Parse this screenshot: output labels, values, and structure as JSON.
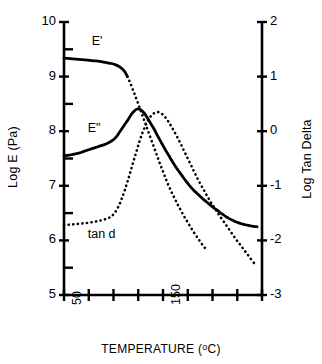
{
  "chart_data": {
    "type": "line",
    "title": "",
    "xlabel": "TEMPERATURE (°C)",
    "ylabel": "Log E (Pa)",
    "y2label": "Log Tan Delta",
    "xlim": [
      50,
      250
    ],
    "ylim": [
      5,
      10
    ],
    "y2lim": [
      -3,
      2
    ],
    "grid": false,
    "legend_position": "inline-annotations",
    "xtick_values": [
      50,
      75,
      100,
      125,
      150,
      175,
      200,
      225,
      250
    ],
    "xtick_labels_shown": [
      "50",
      "150"
    ],
    "xtick_labels_shown_at": [
      50,
      150
    ],
    "ytick_labels_left": [
      "10",
      "9",
      "8",
      "7",
      "6",
      "5"
    ],
    "ytick_values_left": [
      10,
      9,
      8,
      7,
      6,
      5
    ],
    "ytick_labels_right": [
      "2",
      "1",
      "0",
      "-1",
      "-2",
      "-3"
    ],
    "ytick_values_right": [
      2,
      1,
      0,
      -1,
      -2,
      -3
    ],
    "annotations": [
      {
        "text": "E'",
        "x": 78,
        "y_left": 9.62
      },
      {
        "text": "E\"",
        "x": 74,
        "y_left": 8.03
      },
      {
        "text": "tan d",
        "x": 74,
        "y_left": 6.08
      }
    ],
    "series": [
      {
        "name": "E'",
        "axis": "left",
        "style": "solid-then-dotted",
        "x": [
          50,
          56,
          62,
          68,
          74,
          80,
          86,
          92,
          98,
          103,
          107,
          111,
          114,
          117,
          120,
          122.5,
          125,
          127,
          129,
          131,
          133,
          135,
          138,
          141,
          144,
          147,
          150,
          153,
          156,
          159,
          162,
          165,
          168,
          171,
          174,
          177,
          180,
          183,
          186,
          189,
          192,
          195
        ],
        "values": [
          9.34,
          9.33,
          9.32,
          9.31,
          9.3,
          9.29,
          9.28,
          9.26,
          9.24,
          9.21,
          9.17,
          9.1,
          9.0,
          8.88,
          8.74,
          8.62,
          8.5,
          8.4,
          8.3,
          8.2,
          8.1,
          8.0,
          7.85,
          7.7,
          7.55,
          7.4,
          7.26,
          7.12,
          6.99,
          6.87,
          6.76,
          6.65,
          6.55,
          6.45,
          6.36,
          6.27,
          6.18,
          6.1,
          6.02,
          5.94,
          5.87,
          5.8
        ]
      },
      {
        "name": "E\"",
        "axis": "left",
        "style": "solid",
        "x": [
          50,
          55,
          60,
          65,
          70,
          75,
          80,
          85,
          90,
          95,
          99,
          103,
          106,
          109,
          112,
          115,
          117,
          119,
          121,
          123,
          125,
          127,
          129,
          131,
          133,
          135,
          138,
          141,
          145,
          149,
          153,
          157,
          161,
          165,
          169,
          173,
          177,
          181,
          185,
          189,
          193,
          197,
          201,
          205,
          210,
          215,
          220,
          225,
          230,
          235,
          240,
          245
        ],
        "values": [
          7.55,
          7.56,
          7.58,
          7.6,
          7.63,
          7.66,
          7.69,
          7.72,
          7.75,
          7.79,
          7.83,
          7.9,
          7.98,
          8.06,
          8.14,
          8.22,
          8.28,
          8.33,
          8.37,
          8.4,
          8.41,
          8.4,
          8.37,
          8.33,
          8.28,
          8.22,
          8.13,
          8.04,
          7.9,
          7.77,
          7.64,
          7.52,
          7.4,
          7.29,
          7.19,
          7.09,
          7.0,
          6.92,
          6.85,
          6.78,
          6.72,
          6.66,
          6.6,
          6.55,
          6.48,
          6.42,
          6.37,
          6.33,
          6.3,
          6.28,
          6.26,
          6.25
        ]
      },
      {
        "name": "tan d",
        "axis": "right",
        "style": "dotted",
        "x": [
          50,
          56,
          62,
          68,
          74,
          80,
          86,
          92,
          97,
          101,
          105,
          108,
          111,
          114,
          117,
          120,
          123,
          126,
          129,
          132,
          135,
          138,
          141,
          144,
          147,
          150,
          153,
          156,
          159,
          163,
          167,
          171,
          175,
          179,
          183,
          187,
          191,
          195,
          199,
          203,
          208,
          213,
          218,
          223,
          228,
          233,
          238,
          243
        ],
        "values": [
          -1.72,
          -1.71,
          -1.7,
          -1.69,
          -1.68,
          -1.66,
          -1.64,
          -1.61,
          -1.57,
          -1.5,
          -1.38,
          -1.25,
          -1.1,
          -0.93,
          -0.75,
          -0.56,
          -0.38,
          -0.2,
          -0.04,
          0.09,
          0.2,
          0.28,
          0.33,
          0.35,
          0.34,
          0.3,
          0.24,
          0.16,
          0.07,
          -0.06,
          -0.2,
          -0.35,
          -0.5,
          -0.65,
          -0.8,
          -0.94,
          -1.07,
          -1.2,
          -1.32,
          -1.43,
          -1.57,
          -1.7,
          -1.83,
          -1.96,
          -2.08,
          -2.2,
          -2.32,
          -2.44
        ]
      }
    ]
  },
  "axes": {
    "left_title": "Log E (Pa)",
    "right_title": "Log Tan Delta",
    "x_title_main": "TEMPERATURE (",
    "x_title_deg": "o",
    "x_title_tail": "C)"
  },
  "labels": {
    "e_prime": "E'",
    "e_double_prime": "E\"",
    "tan_d": "tan d"
  }
}
